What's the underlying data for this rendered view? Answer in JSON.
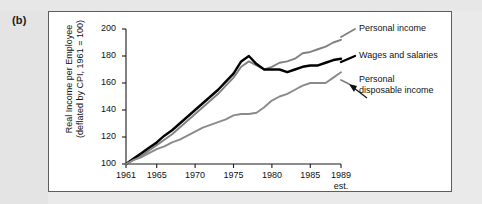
{
  "figure": {
    "panel_label": "(b)"
  },
  "chart_data": {
    "type": "line",
    "title": "",
    "xlabel": "",
    "ylabel": "Real Income per Employee (deflated by CPI, 1961 = 100)",
    "ylabel_line1": "Real Income per Employee",
    "ylabel_line2": "(deflated by CPI, 1961 = 100)",
    "ylim": [
      100,
      200
    ],
    "xlim": [
      1961,
      1989
    ],
    "grid": false,
    "legend_position": "right-inline-labels",
    "ytick_labels": [
      "200",
      "180",
      "160",
      "140",
      "120",
      "100"
    ],
    "yticks": [
      200,
      180,
      160,
      140,
      120,
      100
    ],
    "xtick_labels": [
      "1961",
      "1965",
      "1970",
      "1975",
      "1980",
      "1985",
      "1989"
    ],
    "xticks": [
      1961,
      1965,
      1970,
      1975,
      1980,
      1985,
      1989
    ],
    "x_last_note": "est.",
    "x": [
      1961,
      1962,
      1963,
      1964,
      1965,
      1966,
      1967,
      1968,
      1969,
      1970,
      1971,
      1972,
      1973,
      1974,
      1975,
      1976,
      1977,
      1978,
      1979,
      1980,
      1981,
      1982,
      1983,
      1984,
      1985,
      1986,
      1987,
      1988,
      1989
    ],
    "series": [
      {
        "name": "Personal income",
        "color": "#808080",
        "width": 1.9,
        "values": [
          100,
          103,
          106,
          110,
          114,
          118,
          122,
          127,
          132,
          137,
          142,
          147,
          152,
          158,
          164,
          172,
          176,
          173,
          170,
          172,
          175,
          176,
          178,
          182,
          183,
          185,
          187,
          190,
          192
        ]
      },
      {
        "name": "Wages and salaries",
        "color": "#000000",
        "width": 2.4,
        "values": [
          100,
          104,
          108,
          112,
          116,
          121,
          125,
          130,
          135,
          140,
          145,
          150,
          155,
          161,
          167,
          176,
          180,
          174,
          170,
          170,
          170,
          168,
          170,
          172,
          173,
          173,
          175,
          177,
          178
        ]
      },
      {
        "name": "Personal disposable income",
        "color": "#8a8a8a",
        "width": 1.9,
        "values": [
          100,
          103,
          105,
          108,
          111,
          113,
          116,
          118,
          121,
          124,
          127,
          129,
          131,
          133,
          136,
          137,
          137,
          138,
          142,
          147,
          150,
          152,
          155,
          158,
          160,
          160,
          160,
          164,
          168
        ]
      }
    ],
    "annotations": [
      {
        "name": "personal-income-leader",
        "for": "Personal income"
      },
      {
        "name": "wages-leader",
        "for": "Wages and salaries"
      },
      {
        "name": "disposable-income-arrow",
        "for": "Personal disposable income"
      }
    ]
  },
  "labels": {
    "personal_income": "Personal income",
    "wages_and_salaries": "Wages and salaries",
    "personal_disposable_line1": "Personal",
    "personal_disposable_line2": "disposable income"
  },
  "colors": {
    "series_gray": "#808080",
    "series_black": "#000000",
    "axis": "#1a1a1a",
    "frame": "#5e5e5e",
    "page_background": "#e9e9e9",
    "figure_background": "#ffffff"
  }
}
